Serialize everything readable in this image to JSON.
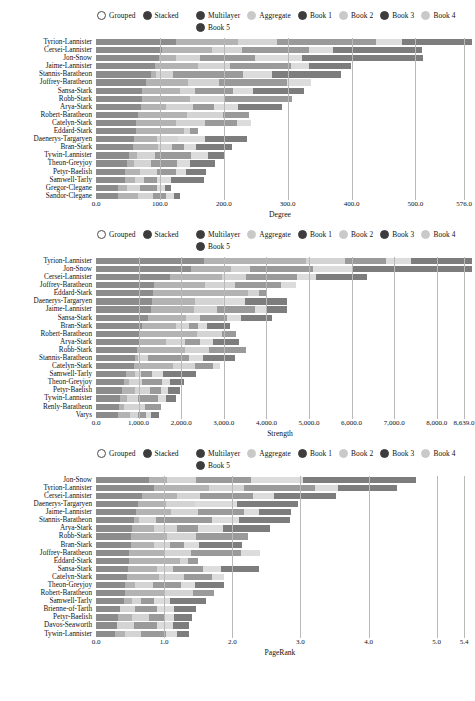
{
  "legend": {
    "mode_options": [
      {
        "label": "Grouped",
        "selected": false
      },
      {
        "label": "Stacked",
        "selected": true
      }
    ],
    "series_options": [
      {
        "label": "Multilayer",
        "active": true,
        "color": "#8c8c8c"
      },
      {
        "label": "Aggregate",
        "active": false,
        "color": "#ededed"
      },
      {
        "label": "Book 1",
        "active": true,
        "color": "#b3b3b3"
      },
      {
        "label": "Book 2",
        "active": false,
        "color": "#d4d4d4"
      },
      {
        "label": "Book 3",
        "active": true,
        "color": "#9a9a9a"
      },
      {
        "label": "Book 4",
        "active": false,
        "color": "#dcdcdc"
      },
      {
        "label": "Book 5",
        "active": true,
        "color": "#7d7d7d"
      }
    ]
  },
  "chart_data": [
    {
      "type": "bar",
      "orientation": "horizontal",
      "stacked": true,
      "title": "",
      "xlabel": "Degree",
      "ylabel": "",
      "xlim": [
        0,
        576
      ],
      "ticks": [
        "0.0",
        "100.0",
        "200.0",
        "300.0",
        "400.0",
        "500.0",
        "576.0"
      ],
      "tickvals": [
        0,
        100,
        200,
        300,
        400,
        500,
        576
      ],
      "grid": true,
      "series": [
        {
          "name": "Multilayer",
          "color": "#8c8c8c"
        },
        {
          "name": "Book 1",
          "color": "#b3b3b3"
        },
        {
          "name": "Book 2",
          "color": "#d4d4d4"
        },
        {
          "name": "Book 3",
          "color": "#9a9a9a"
        },
        {
          "name": "Book 4",
          "color": "#dcdcdc"
        },
        {
          "name": "Book 5",
          "color": "#7d7d7d"
        }
      ],
      "categories": [
        "Tyrion-Lannister",
        "Cersei-Lannister",
        "Jon-Snow",
        "Jaime-Lannister",
        "Stannis-Baratheon",
        "Joffrey-Baratheon",
        "Sansa-Stark",
        "Robb-Stark",
        "Arya-Stark",
        "Robert-Baratheon",
        "Catelyn-Stark",
        "Eddard-Stark",
        "Daenerys-Targaryen",
        "Bran-Stark",
        "Tywin-Lannister",
        "Theon-Greyjoy",
        "Petyr-Baelish",
        "Samwell-Tarly",
        "Gregor-Clegane",
        "Sandor-Clegane"
      ],
      "values": [
        [
          122,
          95,
          60,
          152,
          40,
          107
        ],
        [
          101,
          76,
          46,
          104,
          36,
          137
        ],
        [
          96,
          26,
          37,
          85,
          71,
          186
        ],
        [
          91,
          65,
          49,
          93,
          28,
          65
        ],
        [
          84,
          8,
          26,
          107,
          45,
          105
        ],
        [
          76,
          65,
          48,
          104,
          37,
          0
        ],
        [
          71,
          58,
          23,
          58,
          30,
          78
        ],
        [
          70,
          74,
          53,
          103,
          0,
          0
        ],
        [
          69,
          38,
          42,
          32,
          37,
          67
        ],
        [
          65,
          74,
          55,
          40,
          0,
          0
        ],
        [
          62,
          61,
          44,
          49,
          21,
          0
        ],
        [
          61,
          74,
          9,
          13,
          0,
          0
        ],
        [
          58,
          36,
          31,
          0,
          42,
          64
        ],
        [
          57,
          38,
          22,
          18,
          19,
          55
        ],
        [
          51,
          12,
          28,
          54,
          26,
          26
        ],
        [
          47,
          11,
          26,
          40,
          20,
          38
        ],
        [
          45,
          22,
          27,
          28,
          16,
          31
        ],
        [
          44,
          16,
          13,
          21,
          21,
          50
        ],
        [
          34,
          13,
          21,
          25,
          12,
          10
        ],
        [
          34,
          30,
          24,
          20,
          12,
          8
        ]
      ]
    },
    {
      "type": "bar",
      "orientation": "horizontal",
      "stacked": true,
      "title": "",
      "xlabel": "Strength",
      "ylabel": "",
      "xlim": [
        0,
        8639
      ],
      "ticks": [
        "0.0",
        "1,000.0",
        "2,000.0",
        "3,000.0",
        "4,000.0",
        "5,000.0",
        "6,000.0",
        "7,000.0",
        "8,000.0",
        "8,639.0"
      ],
      "tickvals": [
        0,
        1000,
        2000,
        3000,
        4000,
        5000,
        6000,
        7000,
        8000,
        8639
      ],
      "grid": true,
      "series": [
        {
          "name": "Multilayer",
          "color": "#8c8c8c"
        },
        {
          "name": "Book 1",
          "color": "#b3b3b3"
        },
        {
          "name": "Book 2",
          "color": "#d4d4d4"
        },
        {
          "name": "Book 3",
          "color": "#9a9a9a"
        },
        {
          "name": "Book 4",
          "color": "#dcdcdc"
        },
        {
          "name": "Book 5",
          "color": "#7d7d7d"
        }
      ],
      "categories": [
        "Tyrion-Lannister",
        "Jon-Snow",
        "Cersei-Lannister",
        "Joffrey-Baratheon",
        "Eddard-Stark",
        "Daenerys-Targaryen",
        "Jaime-Lannister",
        "Sansa-Stark",
        "Bran-Stark",
        "Robert-Baratheon",
        "Arya-Stark",
        "Robb-Stark",
        "Stannis-Baratheon",
        "Catelyn-Stark",
        "Samwell-Tarly",
        "Theon-Greyjoy",
        "Petyr-Baelish",
        "Tywin-Lannister",
        "Renly-Baratheon",
        "Varys"
      ],
      "values": [
        [
          2480,
          2350,
          880,
          960,
          570,
          1399
        ],
        [
          2180,
          920,
          430,
          1450,
          900,
          2759
        ],
        [
          1700,
          1190,
          560,
          1180,
          420,
          1180
        ],
        [
          1330,
          1170,
          700,
          1060,
          330,
          0
        ],
        [
          1320,
          2180,
          250,
          170,
          0,
          0
        ],
        [
          1290,
          980,
          640,
          0,
          520,
          950
        ],
        [
          1260,
          1000,
          520,
          870,
          250,
          490
        ],
        [
          1190,
          880,
          330,
          620,
          310,
          720
        ],
        [
          1060,
          780,
          300,
          200,
          200,
          540
        ],
        [
          1000,
          1330,
          560,
          320,
          0,
          0
        ],
        [
          980,
          640,
          420,
          340,
          310,
          600
        ],
        [
          950,
          1090,
          560,
          840,
          0,
          0
        ],
        [
          900,
          60,
          230,
          940,
          330,
          740
        ],
        [
          870,
          900,
          500,
          420,
          160,
          0
        ],
        [
          700,
          200,
          140,
          250,
          260,
          740
        ],
        [
          640,
          120,
          300,
          450,
          180,
          330
        ],
        [
          600,
          300,
          340,
          260,
          150,
          290
        ],
        [
          560,
          150,
          260,
          460,
          190,
          220
        ],
        [
          520,
          130,
          470,
          370,
          0,
          0
        ],
        [
          500,
          290,
          180,
          170,
          120,
          190
        ]
      ]
    },
    {
      "type": "bar",
      "orientation": "horizontal",
      "stacked": true,
      "title": "",
      "xlabel": "PageRank",
      "ylabel": "",
      "xlim": [
        0,
        5.4
      ],
      "ticks": [
        "0.0",
        "1.0",
        "2.0",
        "3.0",
        "4.0",
        "5.0",
        "5.4"
      ],
      "tickvals": [
        0,
        1,
        2,
        3,
        4,
        5,
        5.4
      ],
      "grid": true,
      "series": [
        {
          "name": "Multilayer",
          "color": "#8c8c8c"
        },
        {
          "name": "Book 1",
          "color": "#b3b3b3"
        },
        {
          "name": "Book 2",
          "color": "#d4d4d4"
        },
        {
          "name": "Book 3",
          "color": "#9a9a9a"
        },
        {
          "name": "Book 4",
          "color": "#dcdcdc"
        },
        {
          "name": "Book 5",
          "color": "#7d7d7d"
        }
      ],
      "categories": [
        "Jon-Snow",
        "Tyrion-Lannister",
        "Cersei-Lannister",
        "Daenerys-Targaryen",
        "Jaime-Lannister",
        "Stannis-Baratheon",
        "Arya-Stark",
        "Robb-Stark",
        "Bran-Stark",
        "Joffrey-Baratheon",
        "Eddard-Stark",
        "Sansa-Stark",
        "Catelyn-Stark",
        "Theon-Greyjoy",
        "Robert-Baratheon",
        "Samwell-Tarly",
        "Brienne-of-Tarth",
        "Petyr-Baelish",
        "Davos-Seaworth",
        "Tywin-Lannister"
      ],
      "values": [
        [
          0.76,
          0.26,
          0.42,
          0.78,
          0.75,
          1.62
        ],
        [
          0.83,
          0.8,
          0.49,
          1.02,
          0.34,
          0.85
        ],
        [
          0.66,
          0.5,
          0.34,
          0.75,
          0.3,
          0.9
        ],
        [
          0.6,
          0.4,
          0.42,
          0.0,
          0.6,
          0.88
        ],
        [
          0.58,
          0.5,
          0.38,
          0.66,
          0.22,
          0.46
        ],
        [
          0.55,
          0.07,
          0.24,
          0.8,
          0.4,
          0.72
        ],
        [
          0.52,
          0.31,
          0.34,
          0.3,
          0.35,
          0.68
        ],
        [
          0.5,
          0.52,
          0.41,
          0.76,
          0.0,
          0.0
        ],
        [
          0.5,
          0.34,
          0.22,
          0.2,
          0.22,
          0.62
        ],
        [
          0.48,
          0.49,
          0.4,
          0.72,
          0.26,
          0.0
        ],
        [
          0.48,
          0.72,
          0.12,
          0.14,
          0.0,
          0.0
        ],
        [
          0.46,
          0.42,
          0.22,
          0.44,
          0.26,
          0.54
        ],
        [
          0.44,
          0.46,
          0.36,
          0.4,
          0.18,
          0.0
        ],
        [
          0.42,
          0.14,
          0.26,
          0.4,
          0.2,
          0.42
        ],
        [
          0.42,
          0.56,
          0.42,
          0.3,
          0.0,
          0.0
        ],
        [
          0.4,
          0.12,
          0.12,
          0.2,
          0.22,
          0.52
        ],
        [
          0.34,
          0.0,
          0.22,
          0.32,
          0.24,
          0.32
        ],
        [
          0.32,
          0.2,
          0.24,
          0.22,
          0.14,
          0.26
        ],
        [
          0.3,
          0.0,
          0.24,
          0.34,
          0.22,
          0.24
        ],
        [
          0.28,
          0.14,
          0.22,
          0.36,
          0.16,
          0.18
        ]
      ]
    }
  ]
}
